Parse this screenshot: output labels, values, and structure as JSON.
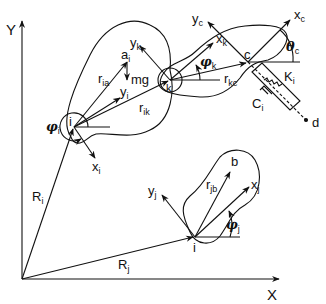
{
  "diagram": {
    "title": "",
    "colors": {
      "ink": "#111111",
      "background": "#ffffff"
    },
    "axes": {
      "x_label": "X",
      "y_label": "Y"
    },
    "bodies": [
      {
        "id": "i",
        "label": "i"
      },
      {
        "id": "k",
        "label": "k"
      },
      {
        "id": "j",
        "label": "j"
      }
    ],
    "labels": {
      "Y": "Y",
      "X": "X",
      "Ri": {
        "main": "R",
        "sub": "i"
      },
      "Rj": {
        "main": "R",
        "sub": "j"
      },
      "point_i": "i",
      "point_k": "k",
      "point_j": "i",
      "point_c": "c",
      "point_a": {
        "main": "a",
        "sub": "i"
      },
      "point_b": "b",
      "point_d": "d",
      "mg": "mg",
      "ria": {
        "main": "r",
        "sub": "ia"
      },
      "rik": {
        "main": "r",
        "sub": "ik"
      },
      "rkc": {
        "main": "r",
        "sub": "kc"
      },
      "rjb": {
        "main": "r",
        "sub": "jb"
      },
      "xi": {
        "main": "x",
        "sub": "i"
      },
      "yi": {
        "main": "y",
        "sub": "i"
      },
      "xk": {
        "main": "x",
        "sub": "k"
      },
      "yk": {
        "main": "y",
        "sub": "k"
      },
      "xj": {
        "main": "x",
        "sub": "j"
      },
      "yj": {
        "main": "y",
        "sub": "j"
      },
      "xc": {
        "main": "x",
        "sub": "c"
      },
      "yc": {
        "main": "y",
        "sub": "c"
      },
      "phi_i": {
        "main": "φ",
        "sub": "i"
      },
      "phi_k": {
        "main": "φ",
        "sub": "k"
      },
      "phi_j": {
        "main": "φ",
        "sub": "j"
      },
      "theta_c": {
        "main": "θ",
        "sub": "c"
      },
      "Ki": {
        "main": "K",
        "sub": "i"
      },
      "Ci": {
        "main": "C",
        "sub": "i"
      }
    }
  }
}
